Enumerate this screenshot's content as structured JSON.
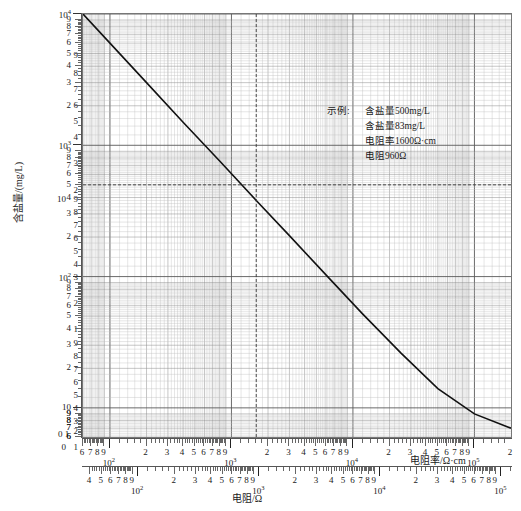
{
  "chart_data": {
    "type": "line",
    "title": "",
    "subtitle": "",
    "ylabel": "含盐量/(mg/L)",
    "xlabel_top": "电阻率/Ω·cm",
    "xlabel_bottom": "电阻/Ω",
    "grid": true,
    "scale": "log-log",
    "legend_position": "none",
    "ylim": [
      6,
      10000
    ],
    "xlim_top": [
      60,
      200000
    ],
    "xlim_bottom": [
      35,
      120000
    ],
    "y_tick_labels": [
      "10⁴",
      "9",
      "8",
      "7",
      "6",
      "5",
      "4",
      "3",
      "2",
      "10³",
      "9",
      "8",
      "7",
      "6",
      "5",
      "4",
      "3",
      "2",
      "10²",
      "9",
      "8",
      "7",
      "6",
      "5",
      "4",
      "3",
      "2",
      "10",
      "9",
      "8",
      "7",
      "6"
    ],
    "y_inner_labels": [
      "9",
      "8",
      "7",
      "6",
      "5",
      "4",
      "3",
      "2",
      "10",
      "9",
      "8",
      "7",
      "6",
      "5",
      "4",
      "3",
      "2",
      "1",
      "9",
      "8",
      "7",
      "6",
      "5",
      "4",
      "3",
      "2",
      "0",
      "1"
    ],
    "x_top_tick_labels": [
      "7",
      "8",
      "9",
      "10²",
      "2",
      "3",
      "4",
      "5",
      "6",
      "7",
      "8",
      "9",
      "10³",
      "2",
      "3",
      "4",
      "5",
      "6",
      "7",
      "8",
      "9",
      "10⁴",
      "2",
      "3",
      "4",
      "5",
      "6",
      "7",
      "8",
      "9",
      "10⁵"
    ],
    "x_bottom_tick_labels": [
      "4",
      "5",
      "6",
      "7",
      "8",
      "9",
      "10²",
      "2",
      "3",
      "4",
      "5",
      "6",
      "7",
      "8",
      "9",
      "10³",
      "2",
      "3",
      "4",
      "5",
      "6",
      "7",
      "8",
      "9",
      "10⁴",
      "2",
      "3",
      "4",
      "5",
      "6",
      "7",
      "8",
      "9",
      "10⁵"
    ],
    "series": [
      {
        "name": "含盐量-电阻率关系曲线",
        "points": [
          [
            60,
            10000
          ],
          [
            100,
            6000
          ],
          [
            200,
            3000
          ],
          [
            400,
            1500
          ],
          [
            800,
            760
          ],
          [
            1600,
            380
          ],
          [
            3000,
            205
          ],
          [
            6000,
            103
          ],
          [
            12000,
            52
          ],
          [
            25000,
            26
          ],
          [
            50000,
            14
          ],
          [
            100000,
            9
          ],
          [
            200000,
            7
          ]
        ]
      }
    ],
    "construction_lines": [
      {
        "orientation": "horizontal",
        "value": 500,
        "style": "dashed"
      },
      {
        "orientation": "vertical",
        "value": 1600,
        "style": "dashed"
      }
    ]
  },
  "annotation": {
    "label": "示例:",
    "lines": [
      "含盐量500mg/L",
      "含盐量83mg/L",
      "电阻率1600Ω·cm",
      "电阻960Ω"
    ]
  },
  "axes": {
    "y_title": "含盐量/(mg/L)",
    "x_top_title": "电阻率/Ω·cm",
    "x_bottom_title": "电阻/Ω",
    "x_top_prefix": "0 1",
    "x_bottom_prefix": ""
  }
}
